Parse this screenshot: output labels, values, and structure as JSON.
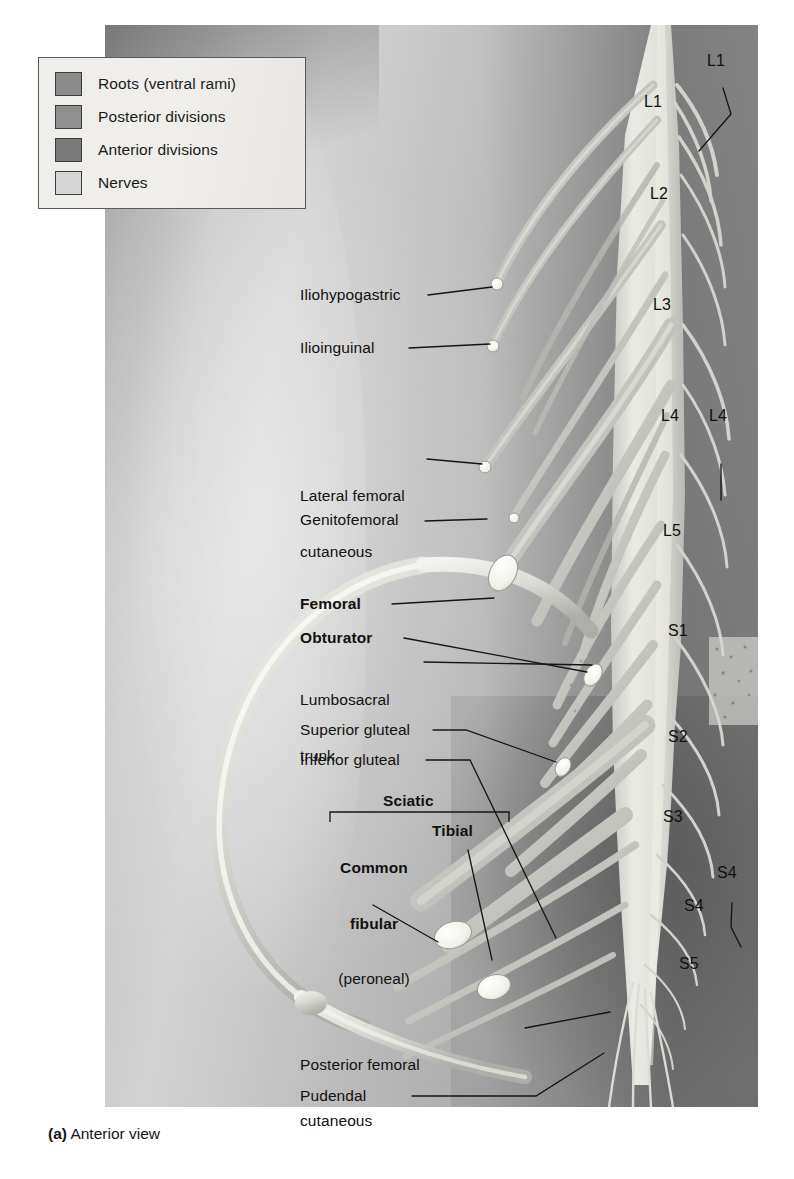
{
  "figure": {
    "caption_prefix": "(a)",
    "caption_text": " Anterior view",
    "view": "Anterior view"
  },
  "legend": {
    "items": [
      {
        "label": "Roots (ventral rami)",
        "color": "#8c8c8c",
        "swatch_name": "swatch-roots"
      },
      {
        "label": "Posterior divisions",
        "color": "#8f8f8f",
        "swatch_name": "swatch-posterior-divisions"
      },
      {
        "label": "Anterior divisions",
        "color": "#7a7a7a",
        "swatch_name": "swatch-anterior-divisions"
      },
      {
        "label": "Nerves",
        "color": "#d6d6d6",
        "swatch_name": "swatch-nerves"
      }
    ]
  },
  "nerve_labels": [
    {
      "id": "iliohypogastric",
      "text": "Iliohypogastric",
      "bold": false
    },
    {
      "id": "ilioinguinal",
      "text": "Ilioinguinal",
      "bold": false
    },
    {
      "id": "lateral-femoral-cutaneous",
      "line1": "Lateral femoral",
      "line2": "cutaneous",
      "bold": false
    },
    {
      "id": "genitofemoral",
      "text": "Genitofemoral",
      "bold": false
    },
    {
      "id": "femoral",
      "text": "Femoral",
      "bold": true
    },
    {
      "id": "obturator",
      "text": "Obturator",
      "bold": true
    },
    {
      "id": "lumbosacral-trunk",
      "line1": "Lumbosacral",
      "line2": "trunk",
      "bold": false
    },
    {
      "id": "superior-gluteal",
      "text": "Superior gluteal",
      "bold": false
    },
    {
      "id": "inferior-gluteal",
      "text": "Inferior gluteal",
      "bold": false
    },
    {
      "id": "sciatic",
      "text": "Sciatic",
      "bold": true
    },
    {
      "id": "common-fibular",
      "line1": "Common",
      "line2": "fibular",
      "line3": "(peroneal)",
      "bold": true
    },
    {
      "id": "tibial",
      "text": "Tibial",
      "bold": true
    },
    {
      "id": "posterior-femoral-cutaneous",
      "line1": "Posterior femoral",
      "line2": "cutaneous",
      "bold": false
    },
    {
      "id": "pudendal",
      "text": "Pudendal",
      "bold": false
    }
  ],
  "spinal_levels": [
    {
      "id": "l1-outer",
      "text": "L1",
      "has_leader": true
    },
    {
      "id": "l1-inner",
      "text": "L1",
      "has_leader": false
    },
    {
      "id": "l2",
      "text": "L2",
      "has_leader": false
    },
    {
      "id": "l3",
      "text": "L3",
      "has_leader": false
    },
    {
      "id": "l4-inner",
      "text": "L4",
      "has_leader": false
    },
    {
      "id": "l4-outer",
      "text": "L4",
      "has_leader": true
    },
    {
      "id": "l5",
      "text": "L5",
      "has_leader": false
    },
    {
      "id": "s1",
      "text": "S1",
      "has_leader": false
    },
    {
      "id": "s2",
      "text": "S2",
      "has_leader": false
    },
    {
      "id": "s3",
      "text": "S3",
      "has_leader": false
    },
    {
      "id": "s4-outer",
      "text": "S4",
      "has_leader": true
    },
    {
      "id": "s4-inner",
      "text": "S4",
      "has_leader": false
    },
    {
      "id": "s5",
      "text": "S5",
      "has_leader": false
    }
  ],
  "palette": {
    "plate_background": "#b8b8b8",
    "legend_background": "#f3f1ec",
    "legend_border": "#5a5a5a",
    "text": "#111111",
    "leader_line": "#1a1a1a",
    "nerve_light": "#e2e2e2",
    "nerve_cut_end": "#f6f6f2",
    "bone_light": "#ededea"
  }
}
